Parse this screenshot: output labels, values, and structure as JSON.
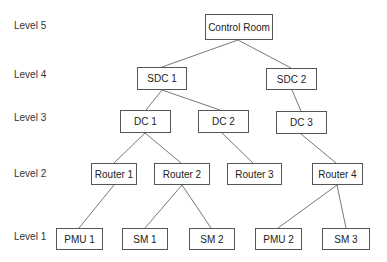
{
  "levels": [
    {
      "label": "Level 5",
      "y": 25
    },
    {
      "label": "Level 4",
      "y": 74
    },
    {
      "label": "Level 3",
      "y": 117
    },
    {
      "label": "Level 2",
      "y": 173
    },
    {
      "label": "Level 1",
      "y": 236
    }
  ],
  "nodes": {
    "control_room": {
      "label": "Control Room",
      "x": 205,
      "y": 14,
      "w": 68,
      "h": 26
    },
    "sdc1": {
      "label": "SDC 1",
      "x": 137,
      "y": 67,
      "w": 50,
      "h": 23
    },
    "sdc2": {
      "label": "SDC 2",
      "x": 266,
      "y": 68,
      "w": 51,
      "h": 22
    },
    "dc1": {
      "label": "DC 1",
      "x": 120,
      "y": 110,
      "w": 51,
      "h": 23
    },
    "dc2": {
      "label": "DC 2",
      "x": 198,
      "y": 110,
      "w": 51,
      "h": 23
    },
    "dc3": {
      "label": "DC 3",
      "x": 276,
      "y": 111,
      "w": 51,
      "h": 23
    },
    "router1": {
      "label": "Router 1",
      "x": 91,
      "y": 163,
      "w": 46,
      "h": 22
    },
    "router2": {
      "label": "Router 2",
      "x": 154,
      "y": 163,
      "w": 56,
      "h": 22
    },
    "router3": {
      "label": "Router 3",
      "x": 227,
      "y": 163,
      "w": 55,
      "h": 22
    },
    "router4": {
      "label": "Router 4",
      "x": 312,
      "y": 163,
      "w": 51,
      "h": 22
    },
    "pmu1": {
      "label": "PMU 1",
      "x": 56,
      "y": 228,
      "w": 47,
      "h": 22
    },
    "sm1": {
      "label": "SM 1",
      "x": 122,
      "y": 228,
      "w": 46,
      "h": 22
    },
    "sm2": {
      "label": "SM 2",
      "x": 189,
      "y": 228,
      "w": 46,
      "h": 22
    },
    "pmu2": {
      "label": "PMU 2",
      "x": 255,
      "y": 228,
      "w": 47,
      "h": 22
    },
    "sm3": {
      "label": "SM 3",
      "x": 322,
      "y": 228,
      "w": 48,
      "h": 22
    }
  },
  "edges": [
    [
      "control_room",
      "sdc1"
    ],
    [
      "control_room",
      "sdc2"
    ],
    [
      "sdc1",
      "dc1"
    ],
    [
      "sdc1",
      "dc2"
    ],
    [
      "sdc2",
      "dc3"
    ],
    [
      "dc1",
      "router1"
    ],
    [
      "dc1",
      "router2"
    ],
    [
      "dc2",
      "router3"
    ],
    [
      "dc3",
      "router4"
    ],
    [
      "router1",
      "pmu1"
    ],
    [
      "router2",
      "sm1"
    ],
    [
      "router2",
      "sm2"
    ],
    [
      "router4",
      "pmu2"
    ],
    [
      "router4",
      "sm3"
    ]
  ]
}
